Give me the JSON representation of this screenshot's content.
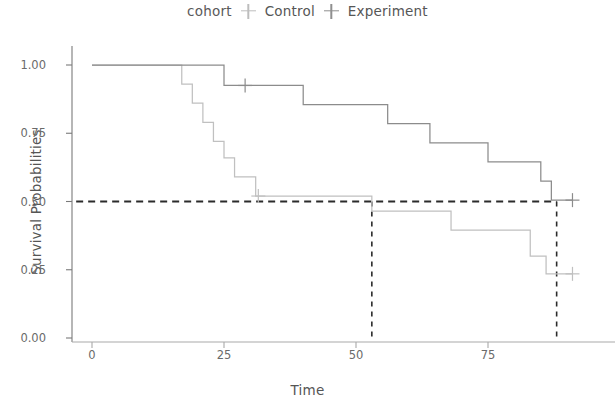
{
  "legend": {
    "title": "cohort",
    "entries": [
      {
        "label": "Control",
        "color": "#c0c0c0",
        "marker": "plus-marker-icon"
      },
      {
        "label": "Experiment",
        "color": "#8c8c8c",
        "marker": "plus-marker-icon"
      }
    ]
  },
  "axes": {
    "x_label": "Time",
    "y_label": "Survival Probabilities",
    "x_ticks": [
      "0",
      "25",
      "50",
      "75"
    ],
    "y_ticks": [
      "0.00",
      "0.25",
      "0.50",
      "0.75",
      "1.00"
    ]
  },
  "chart_data": {
    "type": "line",
    "subtype": "kaplan-meier-step",
    "title": "",
    "xlabel": "Time",
    "ylabel": "Survival Probabilities",
    "xlim": [
      -3,
      92
    ],
    "ylim": [
      0.0,
      1.0
    ],
    "x_ticks": [
      0,
      25,
      50,
      75
    ],
    "y_ticks": [
      0.0,
      0.25,
      0.5,
      0.75,
      1.0
    ],
    "grid": false,
    "legend_position": "top-center",
    "legend_title": "cohort",
    "series": [
      {
        "name": "Control",
        "color": "#c0c0c0",
        "step": "hv",
        "points": [
          {
            "t": 0,
            "s": 1.0
          },
          {
            "t": 17,
            "s": 1.0
          },
          {
            "t": 17,
            "s": 0.93
          },
          {
            "t": 19,
            "s": 0.93
          },
          {
            "t": 19,
            "s": 0.86
          },
          {
            "t": 21,
            "s": 0.86
          },
          {
            "t": 21,
            "s": 0.79
          },
          {
            "t": 23,
            "s": 0.79
          },
          {
            "t": 23,
            "s": 0.72
          },
          {
            "t": 25,
            "s": 0.72
          },
          {
            "t": 25,
            "s": 0.66
          },
          {
            "t": 27,
            "s": 0.66
          },
          {
            "t": 27,
            "s": 0.59
          },
          {
            "t": 31,
            "s": 0.59
          },
          {
            "t": 31,
            "s": 0.52
          },
          {
            "t": 53,
            "s": 0.52
          },
          {
            "t": 53,
            "s": 0.465
          },
          {
            "t": 68,
            "s": 0.465
          },
          {
            "t": 68,
            "s": 0.395
          },
          {
            "t": 83,
            "s": 0.395
          },
          {
            "t": 83,
            "s": 0.3
          },
          {
            "t": 86,
            "s": 0.3
          },
          {
            "t": 86,
            "s": 0.235
          },
          {
            "t": 91,
            "s": 0.235
          }
        ],
        "censored": [
          {
            "t": 31.5,
            "s": 0.52
          },
          {
            "t": 91,
            "s": 0.235
          }
        ]
      },
      {
        "name": "Experiment",
        "color": "#8c8c8c",
        "step": "hv",
        "points": [
          {
            "t": 0,
            "s": 1.0
          },
          {
            "t": 25,
            "s": 1.0
          },
          {
            "t": 25,
            "s": 0.925
          },
          {
            "t": 40,
            "s": 0.925
          },
          {
            "t": 40,
            "s": 0.855
          },
          {
            "t": 56,
            "s": 0.855
          },
          {
            "t": 56,
            "s": 0.785
          },
          {
            "t": 64,
            "s": 0.785
          },
          {
            "t": 64,
            "s": 0.715
          },
          {
            "t": 75,
            "s": 0.715
          },
          {
            "t": 75,
            "s": 0.645
          },
          {
            "t": 85,
            "s": 0.645
          },
          {
            "t": 85,
            "s": 0.575
          },
          {
            "t": 87,
            "s": 0.575
          },
          {
            "t": 87,
            "s": 0.505
          },
          {
            "t": 91,
            "s": 0.505
          }
        ],
        "censored": [
          {
            "t": 29,
            "s": 0.925
          },
          {
            "t": 91,
            "s": 0.505
          }
        ]
      }
    ],
    "annotations": [
      {
        "name": "median-horizontal-line",
        "type": "hline",
        "y": 0.5,
        "style": "dashed",
        "color": "#2b2b2b",
        "x_from": -3,
        "x_to": 88
      },
      {
        "name": "median-control-line",
        "type": "vline",
        "x": 53,
        "style": "dashed",
        "color": "#2b2b2b",
        "y_from": 0.0,
        "y_to": 0.5
      },
      {
        "name": "median-experiment-line",
        "type": "vline",
        "x": 88,
        "style": "dashed",
        "color": "#2b2b2b",
        "y_from": 0.0,
        "y_to": 0.5
      }
    ]
  }
}
